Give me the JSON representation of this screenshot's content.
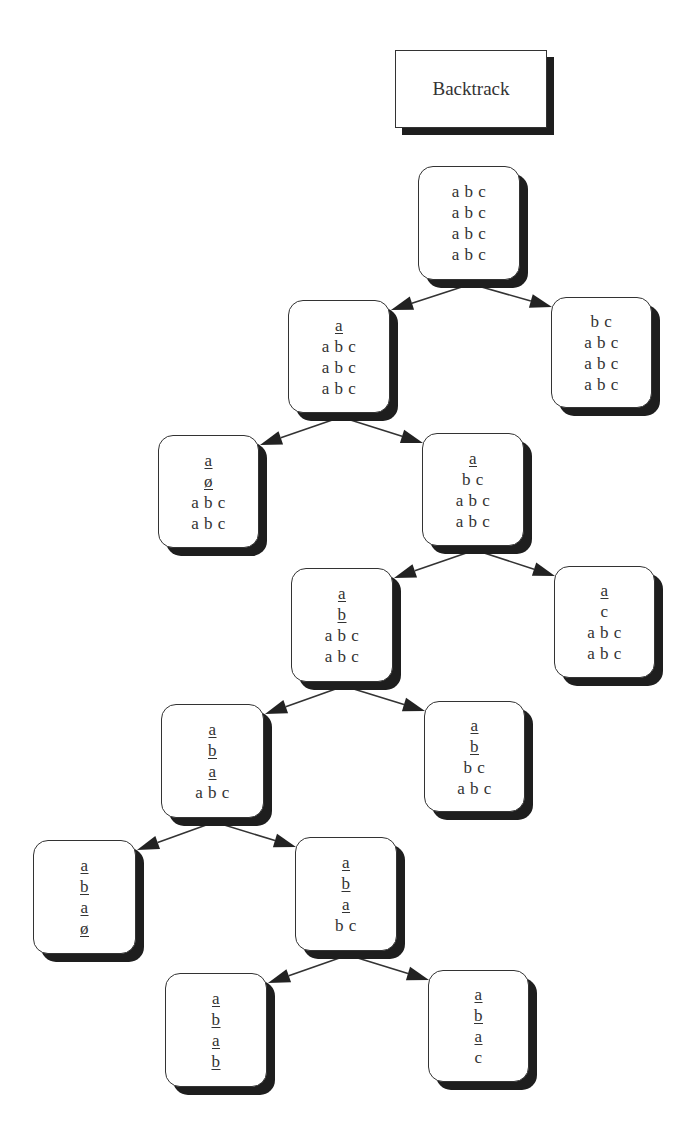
{
  "title": {
    "label": "Backtrack",
    "box": [
      395,
      50,
      152,
      78
    ]
  },
  "colors": {
    "line": "#333333",
    "shadow": "#1e1e1e",
    "background": "#ffffff"
  },
  "nodes": [
    {
      "id": "n0",
      "box": [
        418,
        166,
        102,
        114
      ],
      "lines": [
        {
          "text": "a b c",
          "u": false
        },
        {
          "text": "a b c",
          "u": false
        },
        {
          "text": "a b c",
          "u": false
        },
        {
          "text": "a b c",
          "u": false
        }
      ]
    },
    {
      "id": "n1",
      "box": [
        288,
        300,
        102,
        113
      ],
      "lines": [
        {
          "text": "a",
          "u": true
        },
        {
          "text": "a b c",
          "u": false
        },
        {
          "text": "a b c",
          "u": false
        },
        {
          "text": "a b c",
          "u": false
        }
      ]
    },
    {
      "id": "n2",
      "box": [
        551,
        297,
        101,
        111
      ],
      "lines": [
        {
          "text": "b c",
          "u": false
        },
        {
          "text": "a b c",
          "u": false
        },
        {
          "text": "a b c",
          "u": false
        },
        {
          "text": "a b c",
          "u": false
        }
      ]
    },
    {
      "id": "n3",
      "box": [
        158,
        435,
        101,
        113
      ],
      "lines": [
        {
          "text": "a",
          "u": true
        },
        {
          "text": "ø",
          "u": true
        },
        {
          "text": "a b c",
          "u": false
        },
        {
          "text": "a b c",
          "u": false
        }
      ]
    },
    {
      "id": "n4",
      "box": [
        422,
        433,
        102,
        113
      ],
      "lines": [
        {
          "text": "a",
          "u": true
        },
        {
          "text": "b c",
          "u": false
        },
        {
          "text": "a b c",
          "u": false
        },
        {
          "text": "a b c",
          "u": false
        }
      ]
    },
    {
      "id": "n5",
      "box": [
        291,
        568,
        102,
        114
      ],
      "lines": [
        {
          "text": "a",
          "u": true
        },
        {
          "text": "b",
          "u": true
        },
        {
          "text": "a b c",
          "u": false
        },
        {
          "text": "a b c",
          "u": false
        }
      ]
    },
    {
      "id": "n6",
      "box": [
        554,
        566,
        101,
        112
      ],
      "lines": [
        {
          "text": "a",
          "u": true
        },
        {
          "text": "c",
          "u": false
        },
        {
          "text": "a b c",
          "u": false
        },
        {
          "text": "a b c",
          "u": false
        }
      ]
    },
    {
      "id": "n7",
      "box": [
        161,
        704,
        103,
        114
      ],
      "lines": [
        {
          "text": "a",
          "u": true
        },
        {
          "text": "b",
          "u": true
        },
        {
          "text": "a",
          "u": true
        },
        {
          "text": "a b c",
          "u": false
        }
      ]
    },
    {
      "id": "n8",
      "box": [
        424,
        701,
        101,
        111
      ],
      "lines": [
        {
          "text": "a",
          "u": true
        },
        {
          "text": "b",
          "u": true
        },
        {
          "text": "b c",
          "u": false
        },
        {
          "text": "a b c",
          "u": false
        }
      ]
    },
    {
      "id": "n9",
      "box": [
        33,
        840,
        103,
        114
      ],
      "lines": [
        {
          "text": "a",
          "u": true
        },
        {
          "text": "b",
          "u": true
        },
        {
          "text": "a",
          "u": true
        },
        {
          "text": "ø",
          "u": true
        }
      ]
    },
    {
      "id": "n10",
      "box": [
        295,
        837,
        102,
        114
      ],
      "lines": [
        {
          "text": "a",
          "u": true
        },
        {
          "text": "b",
          "u": true
        },
        {
          "text": "a",
          "u": true
        },
        {
          "text": "b c",
          "u": false
        }
      ]
    },
    {
      "id": "n11",
      "box": [
        165,
        973,
        102,
        114
      ],
      "lines": [
        {
          "text": "a",
          "u": true
        },
        {
          "text": "b",
          "u": true
        },
        {
          "text": "a",
          "u": true
        },
        {
          "text": "b",
          "u": true
        }
      ]
    },
    {
      "id": "n12",
      "box": [
        428,
        970,
        101,
        112
      ],
      "lines": [
        {
          "text": "a",
          "u": true
        },
        {
          "text": "b",
          "u": true
        },
        {
          "text": "a",
          "u": true
        },
        {
          "text": "c",
          "u": false
        }
      ]
    }
  ],
  "edges": [
    {
      "from": "n0",
      "to": "n1"
    },
    {
      "from": "n0",
      "to": "n2"
    },
    {
      "from": "n1",
      "to": "n3"
    },
    {
      "from": "n1",
      "to": "n4"
    },
    {
      "from": "n4",
      "to": "n5"
    },
    {
      "from": "n4",
      "to": "n6"
    },
    {
      "from": "n5",
      "to": "n7"
    },
    {
      "from": "n5",
      "to": "n8"
    },
    {
      "from": "n7",
      "to": "n9"
    },
    {
      "from": "n7",
      "to": "n10"
    },
    {
      "from": "n10",
      "to": "n11"
    },
    {
      "from": "n10",
      "to": "n12"
    }
  ]
}
